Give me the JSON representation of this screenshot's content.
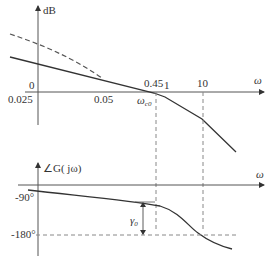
{
  "magnitude_plot": {
    "y_axis_label": "dB",
    "x_axis_label": "ω",
    "zero_label": "0",
    "tick_labels": [
      "0.025",
      "0.05",
      "0.45",
      "1",
      "10"
    ],
    "crossover_label": "ω_c0",
    "crossover_main": "ω",
    "crossover_sub": "c0"
  },
  "phase_plot": {
    "y_axis_label": "∠G( jω)",
    "x_axis_label": "ω",
    "tick_labels": [
      "-90°",
      "-180°"
    ],
    "margin_label_main": "γ",
    "margin_label_sub": "0"
  },
  "colors": {
    "line": "#333333",
    "dashed": "#555555",
    "guide": "#888888"
  }
}
